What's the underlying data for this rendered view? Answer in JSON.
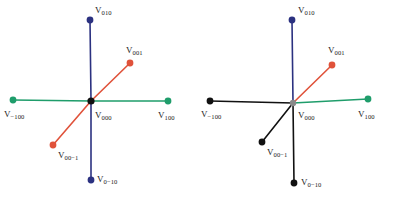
{
  "figure": {
    "type": "diagram",
    "width": 397,
    "height": 199,
    "background": "#ffffff"
  },
  "colors": {
    "blue": "#2b3180",
    "green": "#1f9d6b",
    "orange": "#e0523a",
    "black": "#111111",
    "gray": "#8a8a8a"
  },
  "panels": [
    {
      "id": "panel-left",
      "name": "left-panel",
      "origin": {
        "x": 91,
        "y": 101,
        "color": "#111111",
        "radius": 3.6
      },
      "origin_label": {
        "base": "V",
        "sub": "000",
        "x": 95,
        "y": 111
      },
      "vectors": [
        {
          "name": "v-010",
          "label_base": "V",
          "label_sub": "010",
          "color": "#2b3180",
          "end": {
            "x": 90,
            "y": 20
          },
          "dot": true,
          "label_pos": {
            "x": 95,
            "y": 6
          }
        },
        {
          "name": "v-0-10",
          "label_base": "V",
          "label_sub": "0−10",
          "color": "#2b3180",
          "end": {
            "x": 91,
            "y": 180
          },
          "dot": true,
          "label_pos": {
            "x": 97,
            "y": 175
          }
        },
        {
          "name": "v--100",
          "label_base": "V",
          "label_sub": "−100",
          "color": "#1f9d6b",
          "end": {
            "x": 13,
            "y": 100
          },
          "dot": true,
          "label_pos": {
            "x": 4,
            "y": 110
          }
        },
        {
          "name": "v-100",
          "label_base": "V",
          "label_sub": "100",
          "color": "#1f9d6b",
          "end": {
            "x": 168,
            "y": 101
          },
          "dot": true,
          "label_pos": {
            "x": 158,
            "y": 111
          }
        },
        {
          "name": "v-001",
          "label_base": "V",
          "label_sub": "001",
          "color": "#e0523a",
          "end": {
            "x": 130,
            "y": 63
          },
          "dot": true,
          "label_pos": {
            "x": 126,
            "y": 46
          }
        },
        {
          "name": "v-00-1",
          "label_base": "V",
          "label_sub": "00−1",
          "color": "#e0523a",
          "end": {
            "x": 53,
            "y": 145
          },
          "dot": true,
          "label_pos": {
            "x": 58,
            "y": 151
          }
        }
      ]
    },
    {
      "id": "panel-right",
      "name": "right-panel",
      "origin": {
        "x": 95,
        "y": 103,
        "color": "#8a8a8a",
        "radius": 3.2
      },
      "origin_label": {
        "base": "V",
        "sub": "000",
        "x": 100,
        "y": 111
      },
      "vectors": [
        {
          "name": "v-010",
          "label_base": "V",
          "label_sub": "010",
          "color": "#2b3180",
          "end": {
            "x": 94,
            "y": 20
          },
          "dot": true,
          "label_pos": {
            "x": 100,
            "y": 6
          }
        },
        {
          "name": "v-0-10",
          "label_base": "V",
          "label_sub": "0−10",
          "color": "#111111",
          "end": {
            "x": 96,
            "y": 183
          },
          "dot": true,
          "label_pos": {
            "x": 103,
            "y": 178
          }
        },
        {
          "name": "v--100",
          "label_base": "V",
          "label_sub": "−100",
          "color": "#111111",
          "end": {
            "x": 12,
            "y": 101
          },
          "dot": true,
          "label_pos": {
            "x": 3,
            "y": 110
          }
        },
        {
          "name": "v-100",
          "label_base": "V",
          "label_sub": "100",
          "color": "#1f9d6b",
          "end": {
            "x": 170,
            "y": 99
          },
          "dot": true,
          "label_pos": {
            "x": 160,
            "y": 110
          }
        },
        {
          "name": "v-001",
          "label_base": "V",
          "label_sub": "001",
          "color": "#e0523a",
          "end": {
            "x": 134,
            "y": 65
          },
          "dot": true,
          "label_pos": {
            "x": 130,
            "y": 46
          }
        },
        {
          "name": "v-00-1",
          "label_base": "V",
          "label_sub": "00−1",
          "color": "#111111",
          "end": {
            "x": 64,
            "y": 142
          },
          "dot": true,
          "label_pos": {
            "x": 69,
            "y": 148
          }
        }
      ]
    }
  ]
}
